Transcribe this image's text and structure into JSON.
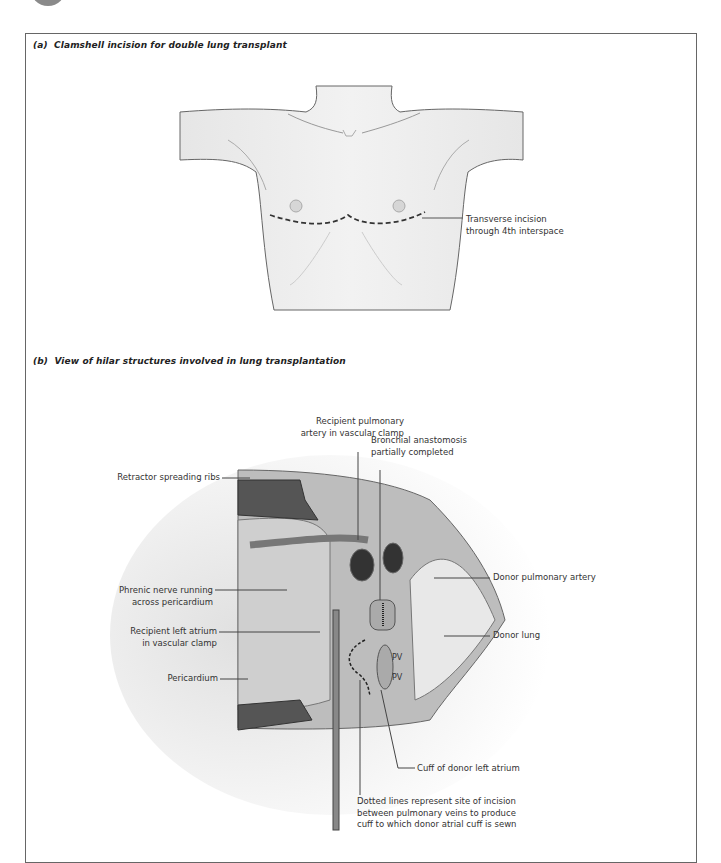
{
  "figure": {
    "panel_a": {
      "letter": "(a)",
      "title": "Clamshell incision for double lung transplant",
      "labels": {
        "incision_line1": "Transverse incision",
        "incision_line2": "through 4th interspace"
      }
    },
    "panel_b": {
      "letter": "(b)",
      "title": "View of hilar structures involved in lung transplantation",
      "labels": {
        "recipient_pa_line1": "Recipient pulmonary",
        "recipient_pa_line2": "artery in vascular clamp",
        "bronchial_line1": "Bronchial anastomosis",
        "bronchial_line2": "partially completed",
        "retractor": "Retractor spreading ribs",
        "phrenic_line1": "Phrenic nerve running",
        "phrenic_line2": "across pericardium",
        "donor_pa": "Donor pulmonary artery",
        "recipient_la_line1": "Recipient left atrium",
        "recipient_la_line2": "in vascular clamp",
        "donor_lung": "Donor lung",
        "pericardium": "Pericardium",
        "pv_upper": "PV",
        "pv_lower": "PV",
        "cuff": "Cuff of donor left atrium",
        "dotted_line1": "Dotted lines represent site of incision",
        "dotted_line2": "between pulmonary veins to produce",
        "dotted_line3": "cuff to which donor atrial cuff is sewn"
      }
    }
  }
}
